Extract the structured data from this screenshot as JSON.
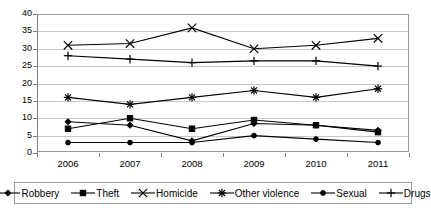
{
  "chart_data": {
    "type": "line",
    "title": "",
    "xlabel": "",
    "ylabel": "",
    "categories": [
      "2006",
      "2007",
      "2008",
      "2009",
      "2010",
      "2011"
    ],
    "ylim": [
      0,
      40
    ],
    "ytick_step": 5,
    "yticks": [
      "0",
      "5",
      "10",
      "15",
      "20",
      "25",
      "30",
      "35",
      "40"
    ],
    "grid": "horizontal",
    "legend_position": "bottom",
    "series": [
      {
        "name": "Robbery",
        "marker": "diamond",
        "values": [
          9,
          8,
          3.5,
          8.5,
          8,
          6.5
        ]
      },
      {
        "name": "Theft",
        "marker": "square",
        "values": [
          7,
          10,
          7,
          9.5,
          8,
          6
        ]
      },
      {
        "name": "Homicide",
        "marker": "cross",
        "values": [
          31,
          31.5,
          36,
          30,
          31,
          33
        ]
      },
      {
        "name": "Other violence",
        "marker": "star",
        "values": [
          16,
          14,
          16,
          18,
          16,
          18.5
        ]
      },
      {
        "name": "Sexual",
        "marker": "dot",
        "values": [
          3,
          3,
          3,
          5,
          4,
          3
        ]
      },
      {
        "name": "Drugs",
        "marker": "plus",
        "values": [
          28,
          27,
          26,
          26.5,
          26.5,
          25
        ]
      }
    ],
    "colors": {
      "line": "#000000",
      "gridline": "#c8c8c8",
      "axis": "#808080",
      "plot_background": "#ffffff"
    }
  },
  "legend": {
    "items": [
      {
        "label": "Robbery",
        "marker": "diamond-marker-icon"
      },
      {
        "label": "Theft",
        "marker": "square-marker-icon"
      },
      {
        "label": "Homicide",
        "marker": "cross-marker-icon"
      },
      {
        "label": "Other violence",
        "marker": "star-marker-icon"
      },
      {
        "label": "Sexual",
        "marker": "dot-marker-icon"
      },
      {
        "label": "Drugs",
        "marker": "plus-marker-icon"
      }
    ]
  }
}
